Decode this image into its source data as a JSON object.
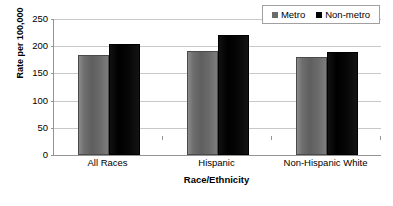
{
  "chart_data": {
    "type": "bar",
    "title": "",
    "xlabel": "Race/Ethnicity",
    "ylabel": "Rate per 100,000",
    "categories": [
      "All Races",
      "Hispanic",
      "Non-Hispanic White"
    ],
    "series": [
      {
        "name": "Metro",
        "color": "#6b6b6b",
        "values": [
          184,
          191,
          180
        ]
      },
      {
        "name": "Non-metro",
        "color": "#000000",
        "values": [
          204,
          220,
          190
        ]
      }
    ],
    "ylim": [
      0,
      250
    ],
    "ytick_labels": [
      "250",
      "200",
      "150",
      "100",
      "50",
      "0"
    ],
    "ytick_values": [
      250,
      200,
      150,
      100,
      50,
      0
    ],
    "grid": "horizontal",
    "legend_position": "top-right"
  },
  "legend": {
    "entries": [
      {
        "label": "Metro",
        "marker": "square-swatch-gray"
      },
      {
        "label": "Non-metro",
        "marker": "square-swatch-black"
      }
    ]
  }
}
